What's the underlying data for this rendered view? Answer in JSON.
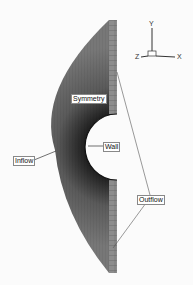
{
  "figure": {
    "type": "computational mesh around half-cylinder (symmetry plane)",
    "labels": {
      "symmetry": "Symmetry",
      "wall": "Wall",
      "inflow": "Inflow",
      "outflow": "Outflow"
    },
    "axes": {
      "y": "Y",
      "z": "Z",
      "x": "X"
    },
    "colors": {
      "background": "#fbfbfb",
      "mesh_dark": "#2a2a2a",
      "mesh_mid": "#6a6a6a",
      "mesh_light": "#9a9a9a",
      "leader_line": "#555555"
    }
  }
}
